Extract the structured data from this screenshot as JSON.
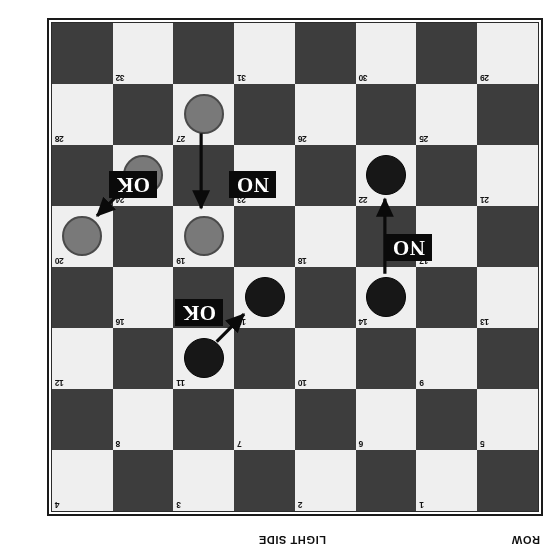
{
  "figure": {
    "kind": "checkers-move-diagram",
    "rotation_degrees": 180,
    "row_axis_label": "ROW",
    "bottom_side_label": "LIGHT SIDE"
  },
  "board": {
    "rows": 8,
    "columns": 8,
    "row_labels": [
      "1",
      "2",
      "3",
      "4",
      "5",
      "6",
      "7",
      "8"
    ],
    "colors": {
      "dark_square": "#3d3d3d",
      "light_square": "#efefef",
      "dark_piece": "#171717",
      "light_piece": "#797979",
      "frame": "#1a1a1a",
      "verdict_chip_bg": "#0a0a0a",
      "verdict_chip_text": "#ffffff",
      "arrow": "#0a0a0a"
    },
    "numbered_squares": [
      {
        "n": "1",
        "row": 1,
        "col": 2
      },
      {
        "n": "2",
        "row": 1,
        "col": 4
      },
      {
        "n": "3",
        "row": 1,
        "col": 6
      },
      {
        "n": "4",
        "row": 1,
        "col": 8
      },
      {
        "n": "5",
        "row": 2,
        "col": 1
      },
      {
        "n": "6",
        "row": 2,
        "col": 3
      },
      {
        "n": "7",
        "row": 2,
        "col": 5
      },
      {
        "n": "8",
        "row": 2,
        "col": 7
      },
      {
        "n": "9",
        "row": 3,
        "col": 2
      },
      {
        "n": "10",
        "row": 3,
        "col": 4
      },
      {
        "n": "11",
        "row": 3,
        "col": 6
      },
      {
        "n": "12",
        "row": 3,
        "col": 8
      },
      {
        "n": "13",
        "row": 4,
        "col": 1
      },
      {
        "n": "14",
        "row": 4,
        "col": 3
      },
      {
        "n": "15",
        "row": 4,
        "col": 5
      },
      {
        "n": "16",
        "row": 4,
        "col": 7
      },
      {
        "n": "17",
        "row": 5,
        "col": 2
      },
      {
        "n": "18",
        "row": 5,
        "col": 4
      },
      {
        "n": "19",
        "row": 5,
        "col": 6
      },
      {
        "n": "20",
        "row": 5,
        "col": 8
      },
      {
        "n": "21",
        "row": 6,
        "col": 1
      },
      {
        "n": "22",
        "row": 6,
        "col": 3
      },
      {
        "n": "23",
        "row": 6,
        "col": 5
      },
      {
        "n": "24",
        "row": 6,
        "col": 7
      },
      {
        "n": "25",
        "row": 7,
        "col": 2
      },
      {
        "n": "26",
        "row": 7,
        "col": 4
      },
      {
        "n": "27",
        "row": 7,
        "col": 6
      },
      {
        "n": "28",
        "row": 7,
        "col": 8
      },
      {
        "n": "29",
        "row": 8,
        "col": 1
      },
      {
        "n": "30",
        "row": 8,
        "col": 3
      },
      {
        "n": "31",
        "row": 8,
        "col": 5
      },
      {
        "n": "32",
        "row": 8,
        "col": 7
      }
    ],
    "pieces": [
      {
        "square": "11",
        "color": "dark",
        "row": 3,
        "col": 6
      },
      {
        "square": "14",
        "color": "dark",
        "row": 4,
        "col": 3
      },
      {
        "square": "15",
        "color": "dark",
        "row": 4,
        "col": 5
      },
      {
        "square": "22",
        "color": "dark",
        "row": 6,
        "col": 3
      },
      {
        "square": "19",
        "color": "light",
        "row": 5,
        "col": 6
      },
      {
        "square": "20",
        "color": "light",
        "row": 5,
        "col": 8
      },
      {
        "square": "24",
        "color": "light",
        "row": 6,
        "col": 7
      },
      {
        "square": "27",
        "color": "light",
        "row": 7,
        "col": 6
      }
    ]
  },
  "moves": [
    {
      "id": "move-11-to-15",
      "from_square": "11",
      "to_square": "15",
      "verdict": "OK",
      "kind": "diagonal"
    },
    {
      "id": "move-14-to-22",
      "from_square": "14",
      "to_square": "22",
      "verdict": "NO",
      "kind": "straight-down"
    },
    {
      "id": "move-27-to-19",
      "from_square": "27",
      "to_square": "19",
      "verdict": "NO",
      "kind": "straight-up"
    },
    {
      "id": "move-24-to-20",
      "from_square": "24",
      "to_square": "20",
      "verdict": "OK",
      "kind": "diagonal"
    }
  ],
  "verdict_labels": {
    "ok": "OK",
    "no": "NO"
  }
}
